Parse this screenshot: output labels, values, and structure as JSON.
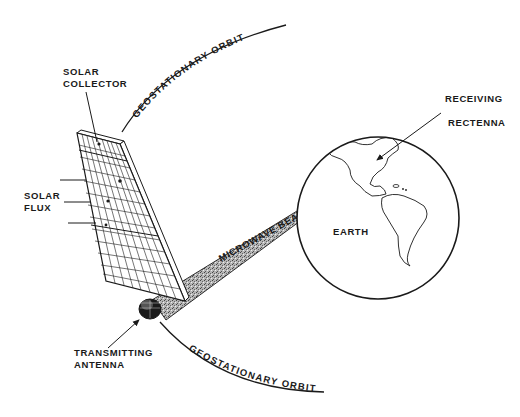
{
  "diagram": {
    "type": "solar-power-satellite-concept",
    "labels": {
      "solar_collector": [
        "SOLAR",
        "COLLECTOR"
      ],
      "solar_flux": [
        "SOLAR",
        "FLUX"
      ],
      "receiving_rectenna": [
        "RECEIVING",
        "RECTENNA"
      ],
      "earth": "EARTH",
      "microwave_beam": "MICROWAVE BEAM",
      "transmitting_antenna": [
        "TRANSMITTING",
        "ANTENNA"
      ],
      "orbit_upper": "GEOSTATIONARY ORBIT",
      "orbit_lower": "GEOSTATIONARY ORBIT"
    },
    "colors": {
      "ink": "#1a1a1a",
      "background": "#ffffff",
      "beam_fill": "#9a9a9a"
    }
  }
}
